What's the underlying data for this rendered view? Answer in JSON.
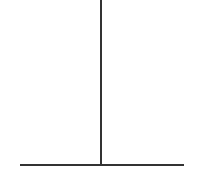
{
  "diagram": {
    "shape": "inverted-t",
    "stroke_color": "#333333",
    "background": "#ffffff",
    "lines": [
      {
        "name": "vertical-line",
        "x1": 101,
        "y1": 0,
        "x2": 101,
        "y2": 164
      },
      {
        "name": "horizontal-line",
        "x1": 20,
        "y1": 164,
        "x2": 184,
        "y2": 164
      }
    ]
  }
}
